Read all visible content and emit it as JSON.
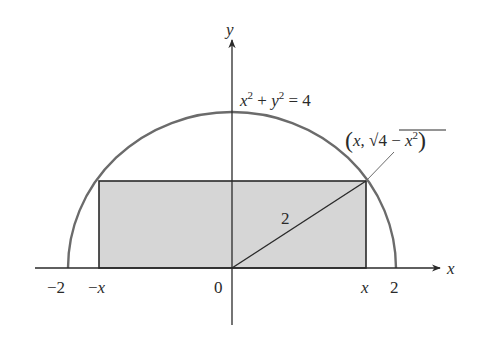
{
  "diagram": {
    "type": "semicircle-inscribed-rectangle",
    "colors": {
      "axis": "#2a2a2a",
      "curve": "#6b6b6b",
      "rect_fill": "#d6d6d6",
      "rect_stroke": "#2a2a2a",
      "text": "#2a2a2a"
    },
    "axes": {
      "x_label": "x",
      "y_label": "y"
    },
    "curve_equation": {
      "lhs_x": "x",
      "exp1": "2",
      "plus": " + ",
      "lhs_y": "y",
      "exp2": "2",
      "rhs": " = 4"
    },
    "point_label": {
      "open": "(",
      "x": "x",
      "comma": ", ",
      "sqrt": "√",
      "inner": "4 − ",
      "inner_x": "x",
      "exp": "2",
      "close": ")"
    },
    "radius_label": "2",
    "ticks": {
      "neg_two": "−2",
      "neg_x_sign": "−",
      "neg_x": "x",
      "zero": "0",
      "x": "x",
      "two": "2"
    }
  }
}
